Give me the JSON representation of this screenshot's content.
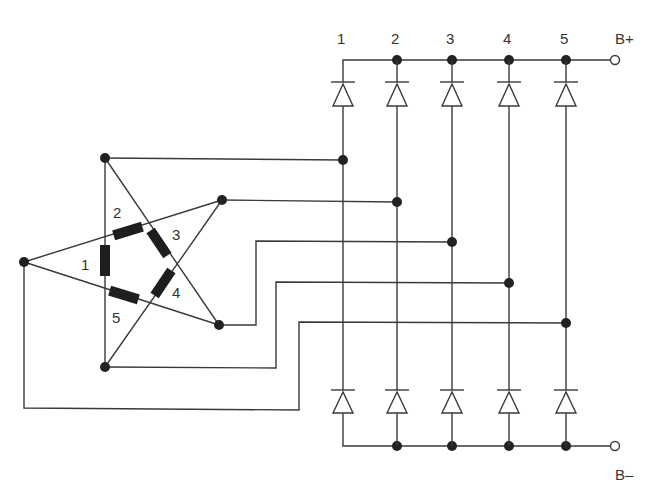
{
  "diagram": {
    "type": "circuit-schematic",
    "column_labels": [
      "1",
      "2",
      "3",
      "4",
      "5"
    ],
    "winding_labels": [
      "1",
      "2",
      "3",
      "4",
      "5"
    ],
    "terminals": {
      "positive": "B+",
      "negative": "B–"
    },
    "colors": {
      "line": "#3a3a3a",
      "node": "#222222",
      "winding": "#1e1e1e",
      "background": "#ffffff"
    }
  }
}
